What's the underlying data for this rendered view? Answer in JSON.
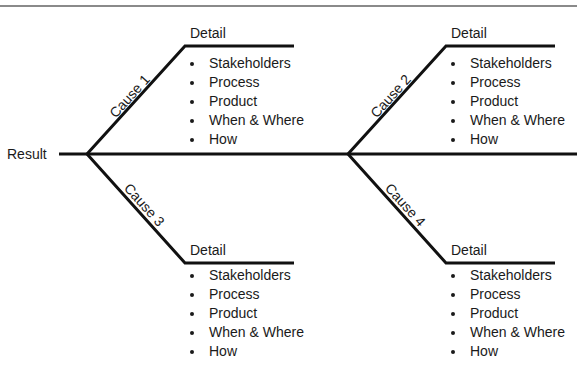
{
  "diagram": {
    "type": "fishbone",
    "header_rule_color": "#8a8a8a",
    "line_color": "#111111",
    "result": {
      "label": "Result"
    },
    "causes": [
      {
        "id": 1,
        "label": "Cause 1",
        "detail_title": "Detail",
        "items": [
          "Stakeholders",
          "Process",
          "Product",
          "When & Where",
          "How"
        ]
      },
      {
        "id": 2,
        "label": "Cause 2",
        "detail_title": "Detail",
        "items": [
          "Stakeholders",
          "Process",
          "Product",
          "When & Where",
          "How"
        ]
      },
      {
        "id": 3,
        "label": "Cause 3",
        "detail_title": "Detail",
        "items": [
          "Stakeholders",
          "Process",
          "Product",
          "When & Where",
          "How"
        ]
      },
      {
        "id": 4,
        "label": "Cause 4",
        "detail_title": "Detail",
        "items": [
          "Stakeholders",
          "Process",
          "Product",
          "When & Where",
          "How"
        ]
      }
    ]
  }
}
